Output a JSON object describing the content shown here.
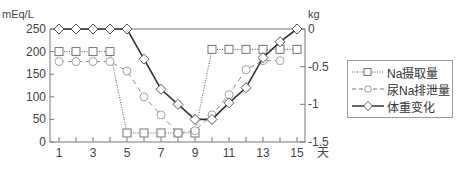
{
  "chart_data": {
    "type": "line",
    "title": "",
    "xlabel": "天",
    "ylabel_left": "mEq/L",
    "ylabel_right": "kg",
    "x": [
      1,
      2,
      3,
      4,
      5,
      6,
      7,
      8,
      9,
      10,
      11,
      12,
      13,
      14,
      15
    ],
    "x_tick_labels": [
      "1",
      "3",
      "5",
      "7",
      "9",
      "11",
      "13",
      "15"
    ],
    "y_left_ticks": [
      "250",
      "200",
      "150",
      "100",
      "50",
      "0"
    ],
    "y_right_ticks": [
      "0",
      "-0.5",
      "-1",
      "-1.5"
    ],
    "ylim_left": [
      0,
      250
    ],
    "ylim_right": [
      -1.5,
      0
    ],
    "grid": false,
    "legend_position": "right",
    "series": [
      {
        "name": "Na摄取量",
        "axis": "left",
        "marker": "square",
        "style": "dotted",
        "values": [
          200,
          200,
          200,
          200,
          20,
          20,
          20,
          20,
          20,
          205,
          205,
          205,
          205,
          205,
          205
        ]
      },
      {
        "name": "尿Na排泄量",
        "axis": "left",
        "marker": "circle",
        "style": "dashed",
        "values": [
          178,
          178,
          178,
          178,
          157,
          100,
          60,
          20,
          25,
          60,
          105,
          160,
          180,
          180,
          null
        ]
      },
      {
        "name": "体重变化",
        "axis": "right",
        "marker": "diamond",
        "style": "solid",
        "values": [
          0,
          0,
          0,
          0,
          0,
          -0.4,
          -0.8,
          -1.0,
          -1.2,
          -1.2,
          -0.98,
          -0.78,
          -0.38,
          -0.17,
          0
        ]
      }
    ]
  },
  "legend": {
    "items": [
      "Na摄取量",
      "尿Na排泄量",
      "体重变化"
    ]
  }
}
